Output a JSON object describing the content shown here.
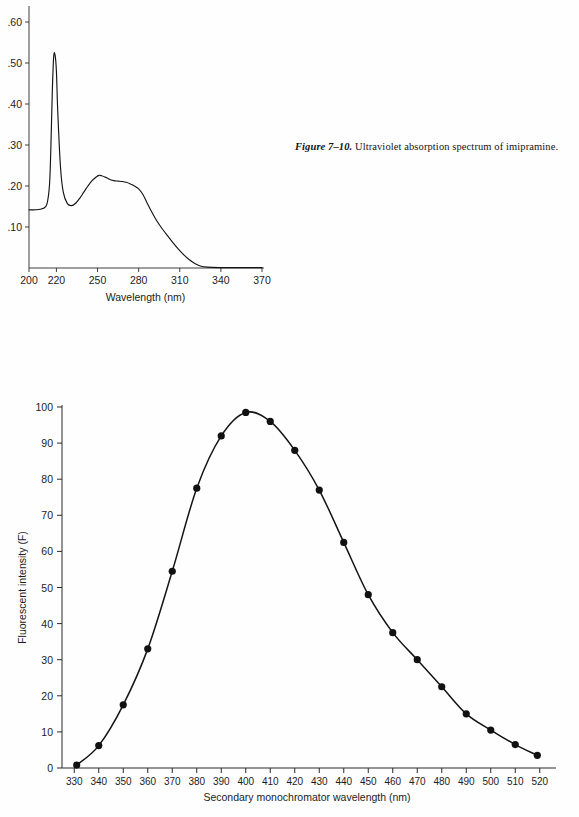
{
  "page": {
    "background": "#fefefe",
    "ink": "#141414"
  },
  "caption": {
    "label": "Figure 7–10.",
    "text": " Ultraviolet absorption spectrum of imipramine."
  },
  "chart_data": [
    {
      "id": "uv-absorption-spectrum",
      "type": "line",
      "title": "",
      "xlabel": "Wavelength (nm)",
      "ylabel": "",
      "xlim": [
        200,
        370
      ],
      "ylim": [
        0,
        0.65
      ],
      "grid": false,
      "legend": null,
      "xticks": [
        200,
        220,
        250,
        280,
        310,
        340,
        370
      ],
      "xtick_labels": [
        "200",
        "220",
        "250",
        "280",
        "310",
        "340",
        "370"
      ],
      "yticks": [
        0.1,
        0.2,
        0.3,
        0.4,
        0.5,
        0.6
      ],
      "ytick_labels": [
        ".10",
        ".20",
        ".30",
        ".40",
        ".50",
        ".60"
      ],
      "series": [
        {
          "name": "imipramine absorbance",
          "x": [
            200,
            205,
            210,
            213,
            215,
            216,
            217,
            218,
            219,
            220,
            221,
            223,
            225,
            228,
            231,
            234,
            237,
            240,
            243,
            246,
            249,
            251,
            253,
            256,
            259,
            262,
            265,
            268,
            271,
            274,
            277,
            280,
            283,
            286,
            289,
            292,
            295,
            298,
            301,
            305,
            309,
            313,
            317,
            321,
            325,
            330,
            340,
            350,
            360,
            370
          ],
          "y": [
            0.142,
            0.142,
            0.145,
            0.155,
            0.205,
            0.3,
            0.43,
            0.515,
            0.52,
            0.48,
            0.38,
            0.245,
            0.185,
            0.157,
            0.152,
            0.158,
            0.17,
            0.185,
            0.2,
            0.213,
            0.222,
            0.226,
            0.225,
            0.221,
            0.216,
            0.213,
            0.212,
            0.211,
            0.209,
            0.205,
            0.2,
            0.193,
            0.18,
            0.16,
            0.14,
            0.122,
            0.106,
            0.092,
            0.079,
            0.062,
            0.046,
            0.032,
            0.02,
            0.011,
            0.005,
            0.002,
            0.001,
            0.001,
            0.001,
            0.001
          ]
        }
      ],
      "notes": {
        "lambda_max_1": "218 nm, A ≈ 0.52",
        "lambda_max_2": "251 nm, A ≈ 0.226",
        "baseline": "0.14 at 200 nm"
      }
    },
    {
      "id": "fluorescence-emission-scan",
      "type": "line",
      "title": "",
      "xlabel": "Secondary monochromator wavelength (nm)",
      "ylabel": "Fluorescent intensity (F)",
      "xlim": [
        325,
        525
      ],
      "ylim": [
        0,
        100
      ],
      "grid": false,
      "legend": null,
      "markers": "filled-circle",
      "xticks": [
        330,
        340,
        350,
        360,
        370,
        380,
        390,
        400,
        410,
        420,
        430,
        440,
        450,
        460,
        470,
        480,
        490,
        500,
        510,
        520
      ],
      "xtick_labels": [
        "330",
        "340",
        "350",
        "360",
        "370",
        "380",
        "390",
        "400",
        "410",
        "420",
        "430",
        "440",
        "450",
        "460",
        "470",
        "480",
        "490",
        "500",
        "510",
        "520"
      ],
      "yticks": [
        0,
        10,
        20,
        30,
        40,
        50,
        60,
        70,
        80,
        90,
        100
      ],
      "ytick_labels": [
        "0",
        "10",
        "20",
        "30",
        "40",
        "50",
        "60",
        "70",
        "80",
        "90",
        "100"
      ],
      "series": [
        {
          "name": "fluorescent intensity",
          "x": [
            331,
            340,
            350,
            360,
            370,
            380,
            390,
            400,
            410,
            420,
            430,
            440,
            450,
            460,
            470,
            480,
            490,
            500,
            510,
            519
          ],
          "y": [
            0.8,
            6.2,
            17.5,
            33.0,
            54.5,
            77.5,
            92.0,
            98.5,
            96.0,
            88.0,
            77.0,
            62.5,
            48.0,
            37.5,
            30.0,
            22.5,
            15.0,
            10.5,
            6.5,
            3.5
          ]
        }
      ],
      "notes": {
        "peak": "≈ 403 nm, F ≈ 100"
      }
    }
  ]
}
